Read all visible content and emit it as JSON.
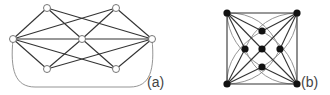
{
  "figure": {
    "panels": [
      {
        "id": "a",
        "label": "(a)",
        "node_style": "open",
        "nodes": {
          "TL": [
            47,
            8
          ],
          "TR": [
            116,
            8
          ],
          "L": [
            13,
            39
          ],
          "C": [
            82,
            39
          ],
          "R": [
            152,
            39
          ],
          "BL": [
            47,
            69
          ],
          "BR": [
            116,
            69
          ]
        },
        "edges": [
          [
            "L",
            "TL"
          ],
          [
            "L",
            "TR"
          ],
          [
            "L",
            "C"
          ],
          [
            "L",
            "BL"
          ],
          [
            "L",
            "BR"
          ],
          [
            "R",
            "TR"
          ],
          [
            "R",
            "TL"
          ],
          [
            "R",
            "C"
          ],
          [
            "R",
            "BR"
          ],
          [
            "R",
            "BL"
          ],
          [
            "C",
            "TL"
          ],
          [
            "C",
            "TR"
          ],
          [
            "C",
            "BL"
          ],
          [
            "C",
            "BR"
          ]
        ],
        "curved_edges": [
          {
            "from": "L",
            "to": "R",
            "path": "M13,39 C10,70 15,87 35,87 L130,87 C150,87 155,70 152,39"
          }
        ]
      },
      {
        "id": "b",
        "label": "(b)",
        "node_style": "filled",
        "nodes": {
          "TL": [
            227,
            13
          ],
          "TR": [
            297,
            13
          ],
          "BL": [
            227,
            84
          ],
          "BR": [
            297,
            84
          ],
          "C": [
            262,
            49
          ],
          "T": [
            262,
            31
          ],
          "Lf": [
            245,
            49
          ],
          "Rt": [
            280,
            49
          ],
          "B": [
            262,
            67
          ]
        },
        "edges": [
          [
            "TL",
            "TR"
          ],
          [
            "TR",
            "BR"
          ],
          [
            "BR",
            "BL"
          ],
          [
            "BL",
            "TL"
          ],
          [
            "TL",
            "C"
          ],
          [
            "TR",
            "C"
          ],
          [
            "BL",
            "C"
          ],
          [
            "BR",
            "C"
          ],
          [
            "TL",
            "T"
          ],
          [
            "TL",
            "Lf"
          ],
          [
            "TR",
            "T"
          ],
          [
            "TR",
            "Rt"
          ],
          [
            "BL",
            "Lf"
          ],
          [
            "BL",
            "B"
          ],
          [
            "BR",
            "Rt"
          ],
          [
            "BR",
            "B"
          ]
        ],
        "curved_edges": [
          {
            "path": "M227,13 Q228,45 262,67"
          },
          {
            "path": "M297,13 Q260,14 245,49"
          },
          {
            "path": "M297,84 Q296,52 262,31"
          },
          {
            "path": "M227,84 Q264,83 280,49"
          },
          {
            "path": "M227,84 Q226,52 262,31"
          },
          {
            "path": "M297,84 Q260,85 245,49"
          },
          {
            "path": "M297,13 Q298,45 262,67"
          },
          {
            "path": "M227,13 Q264,12 280,49"
          }
        ]
      }
    ]
  },
  "colors": {
    "edge": "#333333",
    "curve": "#888888",
    "node_fill_open": "#ffffff",
    "node_fill_solid": "#111111",
    "node_stroke": "#666666"
  }
}
